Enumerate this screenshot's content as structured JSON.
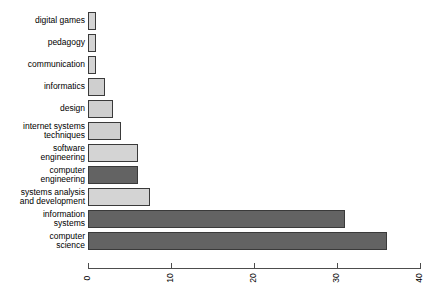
{
  "chart_data": {
    "type": "bar",
    "orientation": "horizontal",
    "title": "",
    "subtitle": "",
    "xlabel": "",
    "ylabel": "",
    "xlim": [
      0,
      40
    ],
    "xticks": [
      "0",
      "10",
      "20",
      "30",
      "40"
    ],
    "xtick_values": [
      0,
      10,
      20,
      30,
      40
    ],
    "grid": false,
    "legend": "none",
    "categories": [
      "digital games",
      "pedagogy",
      "communication",
      "informatics",
      "design",
      "internet systems techniques",
      "software engineering",
      "computer engineering",
      "systems analysis and development",
      "information systems",
      "computer science"
    ],
    "values": [
      1,
      1,
      1,
      2,
      3,
      4,
      6,
      6,
      7.5,
      31,
      36
    ],
    "bar_colors": [
      "#d4d4d4",
      "#d4d4d4",
      "#d4d4d4",
      "#cfcfcf",
      "#cfcfcf",
      "#cfcfcf",
      "#d4d4d4",
      "#636363",
      "#d4d4d4",
      "#636363",
      "#636363"
    ],
    "bar_border_color": "#3a3a3a",
    "bars": [
      {
        "label_line1": "digital games",
        "label_line2": "",
        "value": 1,
        "color": "#d4d4d4"
      },
      {
        "label_line1": "pedagogy",
        "label_line2": "",
        "value": 1,
        "color": "#d4d4d4"
      },
      {
        "label_line1": "communication",
        "label_line2": "",
        "value": 1,
        "color": "#d4d4d4"
      },
      {
        "label_line1": "informatics",
        "label_line2": "",
        "value": 2,
        "color": "#cfcfcf"
      },
      {
        "label_line1": "design",
        "label_line2": "",
        "value": 3,
        "color": "#cfcfcf"
      },
      {
        "label_line1": "internet systems",
        "label_line2": "techniques",
        "value": 4,
        "color": "#cfcfcf"
      },
      {
        "label_line1": "software",
        "label_line2": "engineering",
        "value": 6,
        "color": "#d4d4d4"
      },
      {
        "label_line1": "computer",
        "label_line2": "engineering",
        "value": 6,
        "color": "#636363"
      },
      {
        "label_line1": "systems analysis",
        "label_line2": "and development",
        "value": 7.5,
        "color": "#d4d4d4"
      },
      {
        "label_line1": "information",
        "label_line2": "systems",
        "value": 31,
        "color": "#636363"
      },
      {
        "label_line1": "computer",
        "label_line2": "science",
        "value": 36,
        "color": "#636363"
      }
    ]
  },
  "axis": {
    "ticks": [
      {
        "label": "0",
        "value": 0
      },
      {
        "label": "10",
        "value": 10
      },
      {
        "label": "20",
        "value": 20
      },
      {
        "label": "30",
        "value": 30
      },
      {
        "label": "40",
        "value": 40
      }
    ]
  }
}
